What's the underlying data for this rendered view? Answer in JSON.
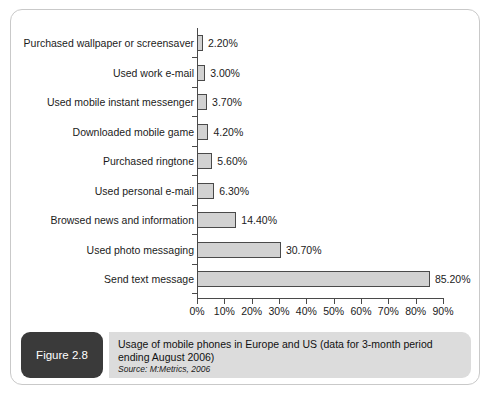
{
  "figure": {
    "badge_label": "Figure 2.8",
    "caption": "Usage of mobile phones in Europe and US (data for 3-month period ending August 2006)",
    "source": "Source: M:Metrics, 2006"
  },
  "colors": {
    "bar_fill": "#d2d2d2",
    "bar_border": "#4a4a4a",
    "axis": "#4a4a4a",
    "badge_background": "#3a3a3a",
    "caption_background": "#dcdcdc",
    "frame_border": "#c9c9c9"
  },
  "chart_data": {
    "type": "bar",
    "orientation": "horizontal",
    "title": "",
    "xlabel": "",
    "ylabel": "",
    "categories": [
      "Purchased wallpaper or screensaver",
      "Used work e-mail",
      "Used mobile instant messenger",
      "Downloaded mobile game",
      "Purchased ringtone",
      "Used personal e-mail",
      "Browsed news and information",
      "Used photo messaging",
      "Send text message"
    ],
    "values": [
      2.2,
      3.0,
      3.7,
      4.2,
      5.6,
      6.3,
      14.4,
      30.7,
      85.2
    ],
    "value_labels": [
      "2.20%",
      "3.00%",
      "3.70%",
      "4.20%",
      "5.60%",
      "6.30%",
      "14.40%",
      "30.70%",
      "85.20%"
    ],
    "xlim": [
      0,
      90
    ],
    "xticks": [
      0,
      10,
      20,
      30,
      40,
      50,
      60,
      70,
      80,
      90
    ],
    "xtick_labels": [
      "0%",
      "10%",
      "20%",
      "30%",
      "40%",
      "50%",
      "60%",
      "70%",
      "80%",
      "90%"
    ],
    "grid": false,
    "legend": false
  }
}
